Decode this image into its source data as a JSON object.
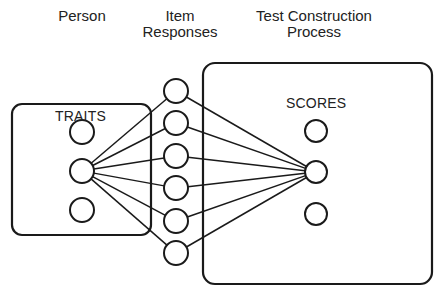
{
  "headers": {
    "person": "Person",
    "item_responses_line1": "Item",
    "item_responses_line2": "Responses",
    "process_line1": "Test Construction",
    "process_line2": "Process"
  },
  "labels": {
    "traits": "TRAITS",
    "scores": "SCORES"
  },
  "nodes": {
    "traits": [
      {
        "cx": 82,
        "cy": 132
      },
      {
        "cx": 82,
        "cy": 171
      },
      {
        "cx": 82,
        "cy": 210
      }
    ],
    "items": [
      {
        "cx": 176,
        "cy": 91
      },
      {
        "cx": 176,
        "cy": 123
      },
      {
        "cx": 176,
        "cy": 156
      },
      {
        "cx": 176,
        "cy": 188
      },
      {
        "cx": 176,
        "cy": 221
      },
      {
        "cx": 176,
        "cy": 253
      }
    ],
    "scores": [
      {
        "cx": 316,
        "cy": 131
      },
      {
        "cx": 316,
        "cy": 172
      },
      {
        "cx": 316,
        "cy": 214
      }
    ]
  },
  "colors": {
    "stroke": "#1a1a1a",
    "background": "#ffffff"
  }
}
